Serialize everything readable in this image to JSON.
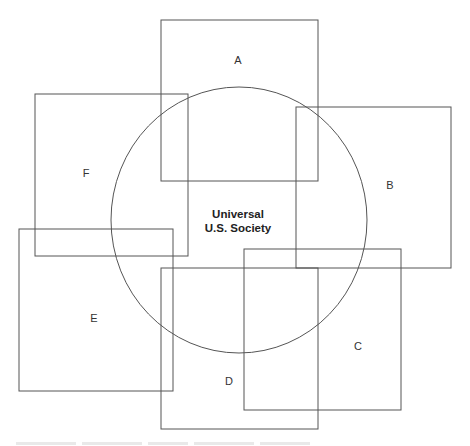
{
  "diagram": {
    "center_label_line1": "Universal",
    "center_label_line2": "U.S. Society",
    "circle": {
      "cx": 239,
      "cy": 220,
      "rx": 128,
      "ry": 133
    },
    "boxes": [
      {
        "id": "A",
        "label": "A",
        "x": 161,
        "y": 20,
        "w": 157,
        "h": 161,
        "lx": 238,
        "ly": 64
      },
      {
        "id": "B",
        "label": "B",
        "x": 296,
        "y": 107,
        "w": 155,
        "h": 161,
        "lx": 390,
        "ly": 189
      },
      {
        "id": "C",
        "label": "C",
        "x": 244,
        "y": 249,
        "w": 157,
        "h": 161,
        "lx": 358,
        "ly": 350
      },
      {
        "id": "D",
        "label": "D",
        "x": 161,
        "y": 268,
        "w": 157,
        "h": 161,
        "lx": 229,
        "ly": 385
      },
      {
        "id": "E",
        "label": "E",
        "x": 19,
        "y": 229,
        "w": 154,
        "h": 162,
        "lx": 94,
        "ly": 322
      },
      {
        "id": "F",
        "label": "F",
        "x": 35,
        "y": 94,
        "w": 153,
        "h": 162,
        "lx": 86,
        "ly": 177
      }
    ],
    "stroke_color": "#555555"
  }
}
